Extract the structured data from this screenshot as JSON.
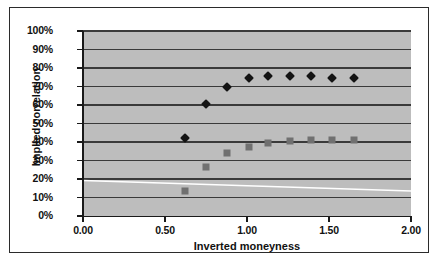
{
  "chart_data": {
    "type": "scatter",
    "title": "",
    "xlabel": "Inverted moneyness",
    "ylabel": "Implied correlation",
    "xlim": [
      0.0,
      2.0
    ],
    "ylim": [
      0.0,
      1.0
    ],
    "grid": true,
    "legend": "none",
    "plot_background": "#bdbdbd",
    "x_ticks": [
      "0.00",
      "0.50",
      "1.00",
      "1.50",
      "2.00"
    ],
    "x_tick_values": [
      0.0,
      0.5,
      1.0,
      1.5,
      2.0
    ],
    "y_ticks": [
      "0%",
      "10%",
      "20%",
      "30%",
      "40%",
      "50%",
      "60%",
      "70%",
      "80%",
      "90%",
      "100%"
    ],
    "y_tick_values": [
      0.0,
      0.1,
      0.2,
      0.3,
      0.4,
      0.5,
      0.6,
      0.7,
      0.8,
      0.9,
      1.0
    ],
    "series": [
      {
        "name": "Implied correlation (diamonds)",
        "marker": "diamond",
        "color": "#141414",
        "x": [
          0.62,
          0.75,
          0.88,
          1.01,
          1.13,
          1.26,
          1.39,
          1.52,
          1.65
        ],
        "y": [
          0.42,
          0.605,
          0.7,
          0.745,
          0.755,
          0.755,
          0.755,
          0.745,
          0.745
        ]
      },
      {
        "name": "Implied correlation (squares)",
        "marker": "square",
        "color": "#707070",
        "x": [
          0.62,
          0.75,
          0.88,
          1.01,
          1.13,
          1.26,
          1.39,
          1.52,
          1.65
        ],
        "y": [
          0.135,
          0.265,
          0.34,
          0.375,
          0.395,
          0.405,
          0.41,
          0.41,
          0.41
        ]
      }
    ],
    "trend_line": {
      "name": "trend-line",
      "color": "#ffffff",
      "x": [
        0.0,
        2.0
      ],
      "y": [
        0.192,
        0.135
      ]
    }
  }
}
